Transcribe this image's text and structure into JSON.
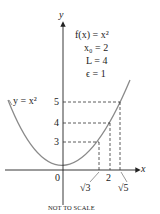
{
  "diagram": {
    "function_label": "f(x) = x²",
    "x0_label": "x₀ = 2",
    "L_label": "L = 4",
    "epsilon_label": "ϵ = 1",
    "curve_label": "y = x²",
    "axis_x_label": "x",
    "axis_y_label": "y",
    "origin_label": "0",
    "y_ticks": [
      "3",
      "4",
      "5"
    ],
    "x_ticks": [
      "√3",
      "2",
      "√5"
    ],
    "caption": "NOT TO SCALE",
    "colors": {
      "curve": "#8a8a8a",
      "axes": "#222222",
      "dashes": "#333333"
    }
  }
}
